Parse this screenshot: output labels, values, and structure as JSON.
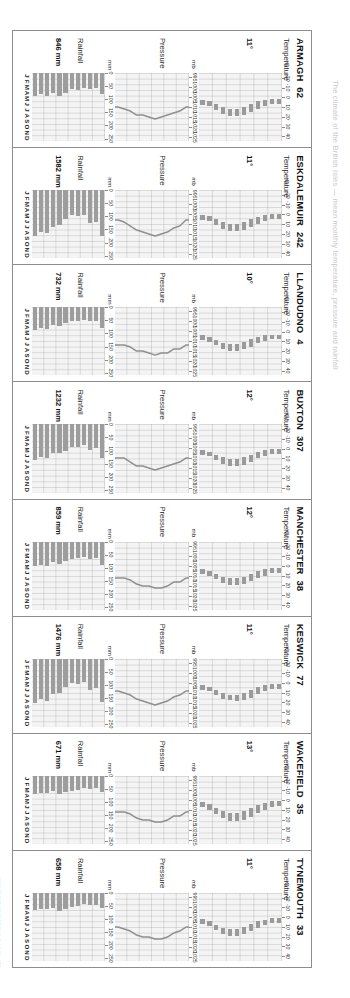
{
  "page": {
    "faint_header": "The climate of the British Isles — mean monthly temperature, pressure and rainfall",
    "copyright": "COPYRIGHT GEORGE PHILIP & SON, LTD"
  },
  "sections": {
    "temperature_label": "Temperature",
    "pressure_label": "Pressure",
    "rainfall_label": "Rainfall"
  },
  "axes": {
    "temperature": {
      "unit": "°C",
      "ticks": [
        "40",
        "30",
        "20",
        "10",
        "0",
        "-10",
        "-20"
      ],
      "min": -25,
      "max": 45
    },
    "pressure": {
      "unit": "mb",
      "ticks": [
        "1025",
        "1020",
        "1015",
        "1010",
        "1005",
        "1000",
        "995"
      ],
      "min": 993,
      "max": 1027
    },
    "rainfall": {
      "unit": "mm",
      "ticks": [
        "250",
        "200",
        "150",
        "100",
        "50",
        "0"
      ],
      "min": 0,
      "max": 260
    }
  },
  "months": [
    "J",
    "F",
    "M",
    "A",
    "M",
    "J",
    "J",
    "A",
    "S",
    "O",
    "N",
    "D"
  ],
  "chart_data": {
    "type": "bar",
    "xlabel": "Month",
    "ylabel": "Temperature (°C) / Pressure (mb) / Rainfall (mm)",
    "stations": [
      {
        "name": "ARMAGH",
        "altitude": "62",
        "mean_temp_label": "11°",
        "rainfall_total_label": "846 mm",
        "temp_min": [
          2,
          2,
          3,
          4,
          7,
          10,
          12,
          12,
          10,
          7,
          4,
          3
        ],
        "temp_max": [
          7,
          7,
          9,
          12,
          15,
          18,
          19,
          19,
          17,
          13,
          9,
          8
        ],
        "pressure": [
          1010,
          1012,
          1013,
          1014,
          1015,
          1016,
          1015,
          1014,
          1014,
          1012,
          1011,
          1010
        ],
        "rainfall": [
          82,
          58,
          60,
          56,
          63,
          62,
          75,
          86,
          78,
          88,
          80,
          88
        ]
      },
      {
        "name": "ESKDALEMUIR",
        "altitude": "242",
        "mean_temp_label": "11°",
        "rainfall_total_label": "1582 mm",
        "temp_min": [
          0,
          0,
          1,
          3,
          5,
          8,
          10,
          10,
          8,
          5,
          2,
          1
        ],
        "temp_max": [
          5,
          5,
          7,
          10,
          13,
          16,
          17,
          17,
          15,
          11,
          7,
          6
        ],
        "pressure": [
          1008,
          1011,
          1012,
          1014,
          1015,
          1016,
          1015,
          1014,
          1013,
          1011,
          1009,
          1008
        ],
        "rainfall": [
          175,
          120,
          125,
          95,
          100,
          95,
          110,
          135,
          140,
          165,
          160,
          175
        ]
      },
      {
        "name": "LLANDUDNO",
        "altitude": "4",
        "mean_temp_label": "10°",
        "rainfall_total_label": "732 mm",
        "temp_min": [
          3,
          3,
          4,
          6,
          8,
          11,
          13,
          13,
          12,
          9,
          6,
          4
        ],
        "temp_max": [
          8,
          8,
          10,
          12,
          16,
          18,
          20,
          20,
          18,
          14,
          11,
          9
        ],
        "pressure": [
          1012,
          1014,
          1014,
          1016,
          1016,
          1017,
          1016,
          1015,
          1015,
          1013,
          1012,
          1012
        ],
        "rainfall": [
          78,
          52,
          52,
          48,
          52,
          52,
          60,
          72,
          68,
          82,
          80,
          86
        ]
      },
      {
        "name": "BUXTON",
        "altitude": "307",
        "mean_temp_label": "12°",
        "rainfall_total_label": "1232 mm",
        "temp_min": [
          0,
          0,
          1,
          3,
          6,
          9,
          11,
          11,
          9,
          6,
          3,
          1
        ],
        "temp_max": [
          5,
          5,
          7,
          10,
          14,
          17,
          18,
          18,
          16,
          12,
          8,
          6
        ],
        "pressure": [
          1010,
          1012,
          1013,
          1014,
          1015,
          1016,
          1015,
          1014,
          1014,
          1012,
          1010,
          1010
        ],
        "rainfall": [
          130,
          92,
          98,
          80,
          85,
          85,
          100,
          110,
          110,
          130,
          125,
          135
        ]
      },
      {
        "name": "MANCHESTER",
        "altitude": "38",
        "mean_temp_label": "12°",
        "rainfall_total_label": "859 mm",
        "temp_min": [
          2,
          2,
          3,
          5,
          8,
          11,
          13,
          13,
          11,
          8,
          5,
          3
        ],
        "temp_max": [
          7,
          7,
          10,
          13,
          16,
          19,
          20,
          20,
          18,
          14,
          10,
          8
        ],
        "pressure": [
          1011,
          1013,
          1013,
          1015,
          1016,
          1016,
          1015,
          1015,
          1014,
          1012,
          1011,
          1011
        ],
        "rainfall": [
          88,
          64,
          66,
          58,
          62,
          66,
          76,
          86,
          80,
          92,
          88,
          95
        ]
      },
      {
        "name": "KESWICK",
        "altitude": "77",
        "mean_temp_label": "11°",
        "rainfall_total_label": "1476 mm",
        "temp_min": [
          1,
          1,
          2,
          4,
          7,
          10,
          12,
          12,
          10,
          7,
          4,
          2
        ],
        "temp_max": [
          6,
          6,
          8,
          11,
          15,
          17,
          19,
          18,
          16,
          12,
          8,
          7
        ],
        "pressure": [
          1009,
          1011,
          1012,
          1014,
          1015,
          1016,
          1015,
          1014,
          1013,
          1011,
          1010,
          1009
        ],
        "rainfall": [
          165,
          112,
          118,
          88,
          95,
          92,
          110,
          130,
          135,
          162,
          155,
          170
        ]
      },
      {
        "name": "WAKEFIELD",
        "altitude": "35",
        "mean_temp_label": "13°",
        "rainfall_total_label": "671 mm",
        "temp_min": [
          1,
          1,
          3,
          5,
          8,
          11,
          13,
          13,
          11,
          8,
          4,
          2
        ],
        "temp_max": [
          6,
          7,
          10,
          13,
          17,
          20,
          21,
          21,
          18,
          14,
          10,
          7
        ],
        "pressure": [
          1011,
          1013,
          1013,
          1015,
          1016,
          1016,
          1015,
          1015,
          1014,
          1012,
          1011,
          1011
        ],
        "rainfall": [
          62,
          48,
          50,
          48,
          55,
          58,
          62,
          68,
          60,
          66,
          64,
          70
        ]
      },
      {
        "name": "TYNEMOUTH",
        "altitude": "33",
        "mean_temp_label": "11°",
        "rainfall_total_label": "658 mm",
        "temp_min": [
          1,
          1,
          3,
          4,
          7,
          10,
          12,
          12,
          11,
          8,
          4,
          2
        ],
        "temp_max": [
          6,
          6,
          8,
          11,
          14,
          17,
          19,
          19,
          17,
          13,
          9,
          7
        ],
        "pressure": [
          1010,
          1012,
          1013,
          1015,
          1016,
          1016,
          1015,
          1015,
          1014,
          1012,
          1011,
          1010
        ],
        "rainfall": [
          58,
          45,
          45,
          44,
          50,
          52,
          62,
          68,
          58,
          62,
          62,
          66
        ]
      }
    ]
  }
}
